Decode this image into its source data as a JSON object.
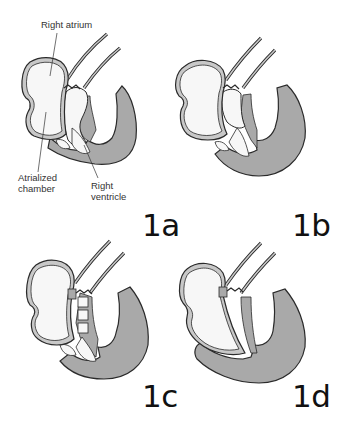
{
  "figure": {
    "panels": [
      {
        "id": "1a",
        "label": "1a"
      },
      {
        "id": "1b",
        "label": "1b"
      },
      {
        "id": "1c",
        "label": "1c"
      },
      {
        "id": "1d",
        "label": "1d"
      }
    ],
    "annotations": {
      "right_atrium": "Right atrium",
      "atrialized_chamber_line1": "Atrialized",
      "atrialized_chamber_line2": "chamber",
      "right_ventricle_line1": "Right",
      "right_ventricle_line2": "ventricle"
    },
    "colors": {
      "myocardium_fill": "#a9a9a9",
      "chamber_fill": "#f7f7f7",
      "outline": "#2a2a2a",
      "wall_fill": "#c8c8c8"
    }
  }
}
